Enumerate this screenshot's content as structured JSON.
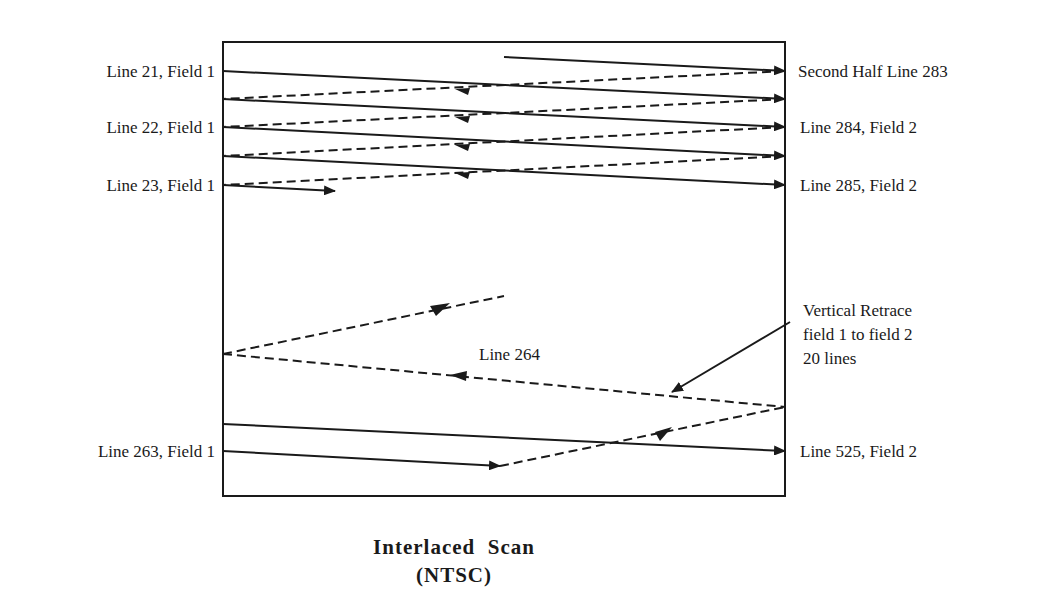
{
  "diagram": {
    "title": "Interlaced  Scan",
    "subtitle": "(NTSC)",
    "left_labels": [
      "Line 21, Field 1",
      "Line 22, Field 1",
      "Line 23, Field 1",
      "Line 263, Field 1"
    ],
    "right_labels": [
      "Second Half Line 283",
      "Line 284, Field 2",
      "Line 285, Field 2",
      "Line 525, Field 2"
    ],
    "center_label": "Line 264",
    "retrace_note": [
      "Vertical Retrace",
      "field 1 to field 2",
      "20 lines"
    ],
    "line_colors": {
      "stroke": "#1a1a1a",
      "background": "#ffffff"
    }
  }
}
